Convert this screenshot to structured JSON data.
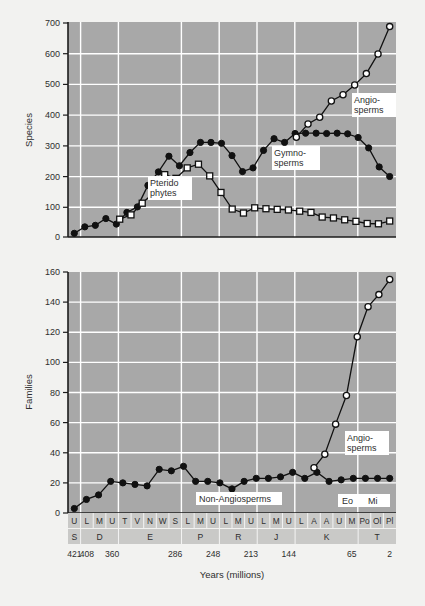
{
  "figure": {
    "background": "#f2f2f0",
    "plot_background": "#a8a8a8",
    "grid_color": "#ffffff",
    "axis_color": "#1c1c1c",
    "xlabel": "Years (millions)"
  },
  "labels": {
    "species_axis": "Species",
    "families_axis": "Families",
    "pteridophytes": "Pterido\nphytes",
    "pteridophytes_l1": "Pterido",
    "pteridophytes_l2": "phytes",
    "gymnosperms_l1": "Gymno-",
    "gymnosperms_l2": "sperms",
    "angiosperms_l1": "Angio-",
    "angiosperms_l2": "sperms",
    "non_angiosperms": "Non-Angiosperms",
    "eocene": "Eo",
    "miocene": "Mi"
  },
  "axis": {
    "stages": [
      "U",
      "L",
      "M",
      "U",
      "T",
      "V",
      "N",
      "W",
      "S",
      "L",
      "M",
      "U",
      "L",
      "M",
      "U",
      "L",
      "M",
      "U",
      "L",
      "A",
      "A",
      "U",
      "M",
      "Po",
      "Ol",
      "Pl"
    ],
    "periods": [
      {
        "label": "S",
        "start": 0,
        "span": 1
      },
      {
        "label": "D",
        "start": 1,
        "span": 3
      },
      {
        "label": "E",
        "start": 4,
        "span": 5
      },
      {
        "label": "P",
        "start": 9,
        "span": 3
      },
      {
        "label": "R",
        "start": 12,
        "span": 3
      },
      {
        "label": "J",
        "start": 15,
        "span": 3
      },
      {
        "label": "K",
        "start": 18,
        "span": 5
      },
      {
        "label": "T",
        "start": 23,
        "span": 3
      }
    ],
    "year_ticks": [
      {
        "value": "421",
        "index": 0
      },
      {
        "value": "408",
        "index": 1
      },
      {
        "value": "360",
        "index": 3
      },
      {
        "value": "286",
        "index": 8
      },
      {
        "value": "248",
        "index": 11
      },
      {
        "value": "213",
        "index": 14
      },
      {
        "value": "144",
        "index": 17
      },
      {
        "value": "65",
        "index": 22
      },
      {
        "value": "2",
        "index": 25
      }
    ]
  },
  "chart_data": [
    {
      "type": "line",
      "title": "",
      "ylabel": "Species",
      "xlabel": "Years (millions)",
      "ylim": [
        0,
        700
      ],
      "yticks": [
        0,
        100,
        200,
        300,
        400,
        500,
        600,
        700
      ],
      "grid": true,
      "legend_position": "inline-annotations",
      "x": [
        "U",
        "L",
        "M",
        "U",
        "T",
        "V",
        "N",
        "W",
        "S",
        "L",
        "M",
        "U",
        "L",
        "M",
        "U",
        "L",
        "M",
        "U",
        "L",
        "A",
        "A",
        "U",
        "M",
        "Po",
        "Ol",
        "Pl"
      ],
      "series": [
        {
          "name": "Gymnosperms",
          "marker": "filled-circle",
          "values": [
            12,
            33,
            38,
            60,
            42,
            80,
            98,
            168,
            212,
            263,
            232,
            275,
            308,
            308,
            305,
            265,
            213,
            225,
            282,
            320,
            308,
            337,
            338,
            338,
            337,
            338,
            336,
            324,
            290,
            228,
            197
          ]
        },
        {
          "name": "Pteridophytes",
          "marker": "open-square",
          "values": [
            null,
            null,
            null,
            null,
            58,
            72,
            110,
            143,
            203,
            191,
            225,
            237,
            199,
            145,
            91,
            78,
            95,
            92,
            90,
            88,
            84,
            80,
            65,
            62,
            56,
            51,
            44,
            43,
            52
          ]
        },
        {
          "name": "Angiosperms",
          "marker": "open-circle",
          "values": [
            325,
            368,
            390,
            443,
            463,
            495,
            532,
            596,
            685
          ]
        }
      ]
    },
    {
      "type": "line",
      "title": "",
      "ylabel": "Families",
      "xlabel": "Years (millions)",
      "ylim": [
        0,
        160
      ],
      "yticks": [
        0,
        20,
        40,
        60,
        80,
        100,
        120,
        140,
        160
      ],
      "grid": true,
      "legend_position": "inline-annotations",
      "x": [
        "U",
        "L",
        "M",
        "U",
        "T",
        "V",
        "N",
        "W",
        "S",
        "L",
        "M",
        "U",
        "L",
        "M",
        "U",
        "L",
        "M",
        "U",
        "L",
        "A",
        "A",
        "U",
        "M",
        "Po",
        "Ol",
        "Pl"
      ],
      "series": [
        {
          "name": "Non-Angiosperms",
          "marker": "filled-circle",
          "values": [
            3,
            9,
            12,
            21,
            20,
            19,
            18,
            29,
            28,
            31,
            21,
            21,
            20,
            16,
            21,
            23,
            23,
            24,
            27,
            23,
            27,
            21,
            22,
            23,
            23,
            23,
            23
          ]
        },
        {
          "name": "Angiosperms",
          "marker": "open-circle",
          "values": [
            30,
            39,
            59,
            78,
            117,
            137,
            145,
            155
          ]
        }
      ]
    }
  ]
}
